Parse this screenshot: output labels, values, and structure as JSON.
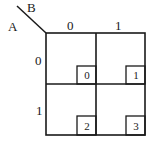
{
  "diagram": {
    "type": "karnaugh-map",
    "variables": {
      "row": "A",
      "col": "B"
    },
    "column_headers": [
      "0",
      "1"
    ],
    "row_headers": [
      "0",
      "1"
    ],
    "cells": [
      {
        "row": 0,
        "col": 0,
        "index": "0"
      },
      {
        "row": 0,
        "col": 1,
        "index": "1"
      },
      {
        "row": 1,
        "col": 0,
        "index": "2"
      },
      {
        "row": 1,
        "col": 1,
        "index": "3"
      }
    ]
  }
}
